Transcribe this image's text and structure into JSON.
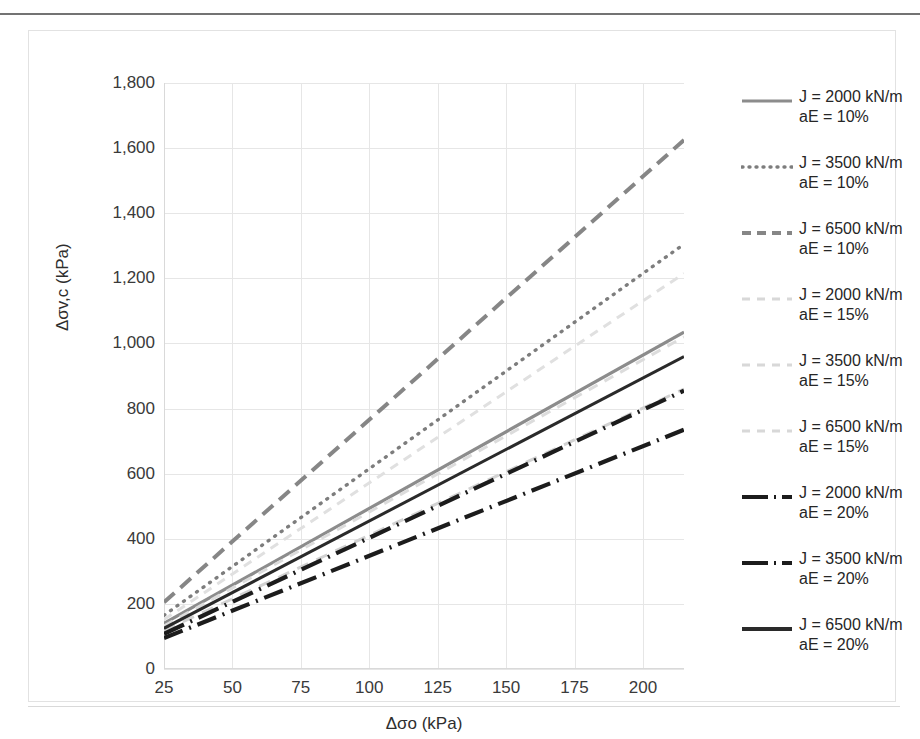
{
  "chart_data": {
    "type": "line",
    "title": "",
    "xlabel": "Δσo (kPa)",
    "ylabel": "Δσv,c (kPa)",
    "xlim": [
      25,
      215
    ],
    "ylim": [
      0,
      1800
    ],
    "xticks": [
      25,
      50,
      75,
      100,
      125,
      150,
      175,
      200
    ],
    "yticks": [
      0,
      200,
      400,
      600,
      800,
      1000,
      1200,
      1400,
      1600,
      1800
    ],
    "ytick_labels": [
      "0",
      "200",
      "400",
      "600",
      "800",
      "1,000",
      "1,200",
      "1,400",
      "1,600",
      "1,800"
    ],
    "xtick_labels": [
      "25",
      "50",
      "75",
      "100",
      "125",
      "150",
      "175",
      "200"
    ],
    "grid": true,
    "legend_position": "right",
    "x": [
      25,
      215
    ],
    "series": [
      {
        "name": "J = 2000 kN/m aE = 10%",
        "j": "2000",
        "ae": "10%",
        "label_line1": "J = 2000 kN/m",
        "label_line2": "aE = 15%",
        "values": [
          140,
          1035
        ],
        "color": "#8c8c8c",
        "style": "solid",
        "width": 3.2,
        "dash": ""
      },
      {
        "name": "J = 3500 kN/m aE = 10%",
        "j": "3500",
        "ae": "10%",
        "label_line1": "J = 3500 kN/m",
        "label_line2": "aE = 10%",
        "values": [
          165,
          1305
        ],
        "color": "#7d7d7d",
        "style": "dotted",
        "width": 3.4,
        "dash": "1,7"
      },
      {
        "name": "J = 6500 kN/m aE = 10%",
        "j": "6500",
        "ae": "10%",
        "label_line1": "J = 6500 kN/m",
        "label_line2": "aE = 10%",
        "values": [
          205,
          1625
        ],
        "color": "#868686",
        "style": "dashed",
        "width": 4.0,
        "dash": "14,8"
      },
      {
        "name": "J = 2000 kN/m aE = 15%",
        "j": "2000",
        "ae": "15%",
        "label_line1": "J = 2000 kN/m",
        "label_line2": "aE = 15%",
        "values": [
          118,
          860
        ],
        "color": "#d2d2d2",
        "style": "dashed-light",
        "width": 3.0,
        "dash": "12,9"
      },
      {
        "name": "J = 3500 kN/m aE = 15%",
        "j": "3500",
        "ae": "15%",
        "label_line1": "J = 3500 kN/m",
        "label_line2": "aE = 15%",
        "values": [
          132,
          1020
        ],
        "color": "#dcdcdc",
        "style": "dashed-light",
        "width": 3.0,
        "dash": "10,8"
      },
      {
        "name": "J = 6500 kN/m aE = 15%",
        "j": "6500",
        "ae": "15%",
        "label_line1": "J = 6500 kN/m",
        "label_line2": "aE = 15%",
        "values": [
          152,
          1215
        ],
        "color": "#e0e0e0",
        "style": "dashed-light",
        "width": 3.0,
        "dash": "9,7"
      },
      {
        "name": "J = 2000 kN/m aE = 20%",
        "j": "2000",
        "ae": "20%",
        "label_line1": "J = 2000 kN/m",
        "label_line2": "aE = 20%",
        "values": [
          95,
          735
        ],
        "color": "#1c1c1c",
        "style": "dash-dot",
        "width": 4.2,
        "dash": "20,7,2,7"
      },
      {
        "name": "J = 3500 kN/m aE = 20%",
        "j": "3500",
        "ae": "20%",
        "label_line1": "J = 3500 kN/m",
        "label_line2": "aE = 20%",
        "values": [
          108,
          855
        ],
        "color": "#1c1c1c",
        "style": "dash-dot",
        "width": 4.2,
        "dash": "22,7,2,7"
      },
      {
        "name": "J = 6500 kN/m aE = 20%",
        "j": "6500",
        "ae": "20%",
        "label_line1": "J = 6500 kN/m",
        "label_line2": "aE = 20%",
        "values": [
          125,
          960
        ],
        "color": "#2a2a2a",
        "style": "solid",
        "width": 3.0,
        "dash": ""
      }
    ]
  },
  "legend": {
    "items": [
      {
        "line1": "J = 2000 kN/m",
        "line2": "aE = 10%",
        "swatch": "solid-gray"
      },
      {
        "line1": "J = 3500 kN/m",
        "line2": "aE = 10%",
        "swatch": "dotted-gray"
      },
      {
        "line1": "J = 6500 kN/m",
        "line2": "aE = 10%",
        "swatch": "dashed-gray"
      },
      {
        "line1": "J = 2000 kN/m",
        "line2": "aE = 15%",
        "swatch": "dashed-light"
      },
      {
        "line1": "J = 3500 kN/m",
        "line2": "aE = 15%",
        "swatch": "dashed-light"
      },
      {
        "line1": "J = 6500 kN/m",
        "line2": "aE = 15%",
        "swatch": "dashed-light"
      },
      {
        "line1": "J = 2000 kN/m",
        "line2": "aE = 20%",
        "swatch": "dash-dot-black"
      },
      {
        "line1": "J = 3500 kN/m",
        "line2": "aE = 20%",
        "swatch": "dash-dot-black"
      },
      {
        "line1": "J = 6500 kN/m",
        "line2": "aE = 20%",
        "swatch": "solid-black"
      }
    ]
  }
}
